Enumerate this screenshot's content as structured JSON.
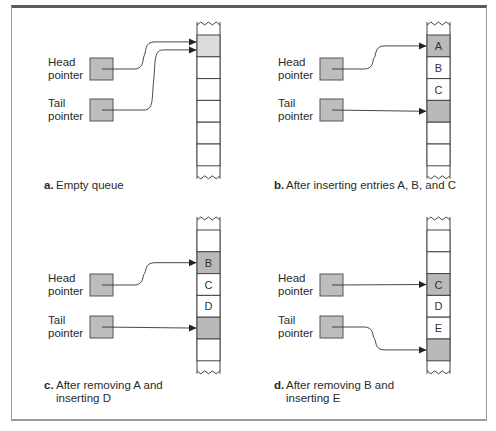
{
  "labels": {
    "head": [
      "Head",
      "pointer"
    ],
    "tail": [
      "Tail",
      "pointer"
    ]
  },
  "colors": {
    "frame_top": "#5a5a5a",
    "frame_side": "#9a9a9a",
    "pointer_box": "#bdbdbd",
    "empty_head_cell": "#dcdcdc",
    "pointed_cell": "#b9b9b9",
    "line": "#333333"
  },
  "panels": [
    {
      "id": "a",
      "caption_letter": "a.",
      "caption_lines": [
        "Empty queue"
      ],
      "cells": [
        "",
        "",
        "",
        "",
        "",
        ""
      ],
      "head_index": 0,
      "tail_index": 0
    },
    {
      "id": "b",
      "caption_letter": "b.",
      "caption_lines": [
        "After inserting entries A, B, and C"
      ],
      "cells": [
        "A",
        "B",
        "C",
        "",
        "",
        ""
      ],
      "head_index": 0,
      "tail_index": 3
    },
    {
      "id": "c",
      "caption_letter": "c.",
      "caption_lines": [
        "After removing A and",
        "inserting D"
      ],
      "cells": [
        "",
        "B",
        "C",
        "D",
        "",
        ""
      ],
      "head_index": 1,
      "tail_index": 4
    },
    {
      "id": "d",
      "caption_letter": "d.",
      "caption_lines": [
        "After removing B and",
        "inserting E"
      ],
      "cells": [
        "",
        "",
        "C",
        "D",
        "E",
        ""
      ],
      "head_index": 2,
      "tail_index": 5
    }
  ]
}
